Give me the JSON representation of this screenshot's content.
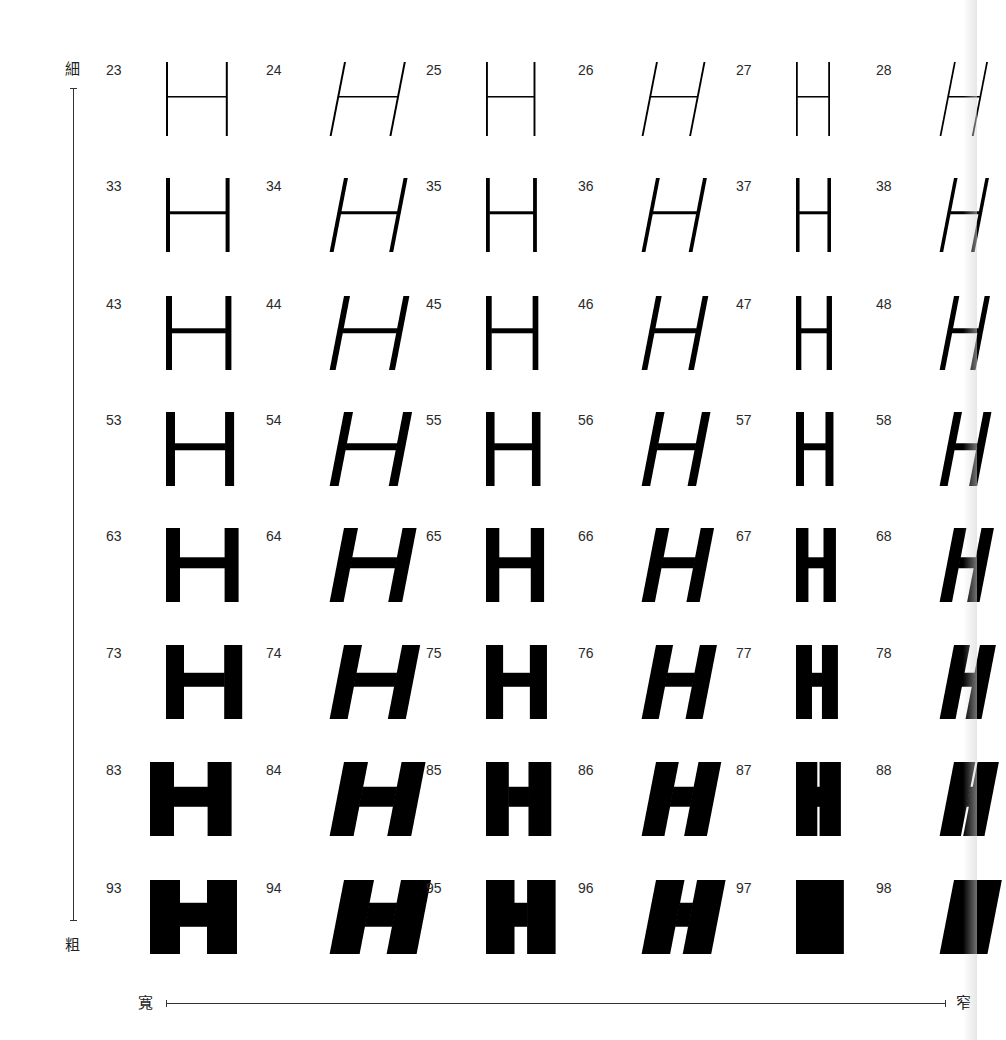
{
  "axes": {
    "vertical_top_label": "細",
    "vertical_bottom_label": "粗",
    "horizontal_left_label": "寬",
    "horizontal_right_label": "窄"
  },
  "glyph": "H",
  "columns": [
    {
      "suffix": "3",
      "x": 106,
      "italic": false,
      "width_factor": 1.0
    },
    {
      "suffix": "4",
      "x": 266,
      "italic": true,
      "width_factor": 1.0
    },
    {
      "suffix": "5",
      "x": 426,
      "italic": false,
      "width_factor": 0.8
    },
    {
      "suffix": "6",
      "x": 578,
      "italic": true,
      "width_factor": 0.8
    },
    {
      "suffix": "7",
      "x": 736,
      "italic": false,
      "width_factor": 0.55
    },
    {
      "suffix": "8",
      "x": 876,
      "italic": true,
      "width_factor": 0.55
    }
  ],
  "rows": [
    {
      "prefix": "2",
      "y": 62,
      "stem": 2,
      "bar": 1.5
    },
    {
      "prefix": "3",
      "y": 178,
      "stem": 4,
      "bar": 3
    },
    {
      "prefix": "4",
      "y": 296,
      "stem": 6,
      "bar": 5
    },
    {
      "prefix": "5",
      "y": 412,
      "stem": 9,
      "bar": 7
    },
    {
      "prefix": "6",
      "y": 528,
      "stem": 14,
      "bar": 11
    },
    {
      "prefix": "7",
      "y": 645,
      "stem": 18,
      "bar": 14
    },
    {
      "prefix": "8",
      "y": 762,
      "stem": 24,
      "bar": 20
    },
    {
      "prefix": "9",
      "y": 880,
      "stem": 30,
      "bar": 24
    }
  ],
  "cells": [
    [
      "23",
      "24",
      "25",
      "26",
      "27",
      "28"
    ],
    [
      "33",
      "34",
      "35",
      "36",
      "37",
      "38"
    ],
    [
      "43",
      "44",
      "45",
      "46",
      "47",
      "48"
    ],
    [
      "53",
      "54",
      "55",
      "56",
      "57",
      "58"
    ],
    [
      "63",
      "64",
      "65",
      "66",
      "67",
      "68"
    ],
    [
      "73",
      "74",
      "75",
      "76",
      "77",
      "78"
    ],
    [
      "83",
      "84",
      "85",
      "86",
      "87",
      "88"
    ],
    [
      "93",
      "94",
      "95",
      "96",
      "97",
      "98"
    ]
  ],
  "colors": {
    "ink": "#000000",
    "label": "#2a2a2a",
    "paper": "#ffffff"
  }
}
